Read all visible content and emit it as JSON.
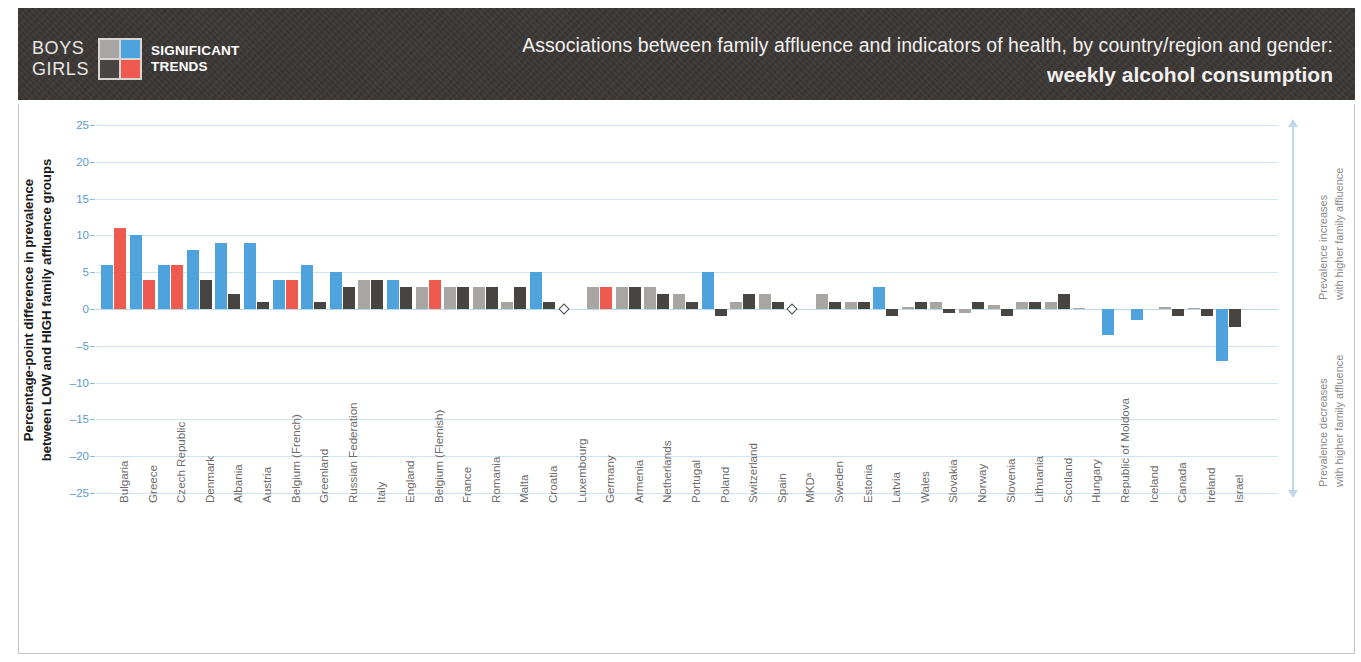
{
  "header": {
    "legend": {
      "boys_label": "BOYS",
      "girls_label": "GIRLS",
      "significant_line1": "SIGNIFICANT",
      "significant_line2": "TRENDS",
      "swatch_boys_nonsig": "#a8a5a2",
      "swatch_boys_sig": "#4ea3dd",
      "swatch_girls_nonsig": "#474442",
      "swatch_girls_sig": "#ee5a4f"
    },
    "title_line1": "Associations between family affluence and indicators of health, by country/region and gender:",
    "title_line2": "weekly alcohol consumption",
    "bg_color": "#3a3634"
  },
  "right_annotation": {
    "increase_bold": "increases",
    "increase_text": "Prevalence increases\nwith higher family affluence",
    "decrease_text": "Prevalence decreases\nwith higher family affluence",
    "axis_color": "#bcd9ec"
  },
  "chart_data": {
    "type": "bar",
    "title": "Associations between family affluence and indicators of health, by country/region and gender: weekly alcohol consumption",
    "xlabel": "",
    "ylabel": "Percentage-point difference in prevalence\nbetween LOW and HIGH family affluence groups",
    "ylim": [
      -25,
      25
    ],
    "yticks": [
      25,
      20,
      15,
      10,
      5,
      0,
      -5,
      -10,
      -15,
      -20,
      -25
    ],
    "grid": true,
    "legend_position": "header-left",
    "series_names": [
      "Boys",
      "Girls"
    ],
    "colors": {
      "boys_significant": "#4ea3dd",
      "boys_nonsignificant": "#a8a5a2",
      "girls_significant": "#ee5a4f",
      "girls_nonsignificant": "#474442",
      "grid": "#cfe4f2",
      "tick_text": "#5b9bd0",
      "category_text": "#6e6b69"
    },
    "categories": [
      "Bulgaria",
      "Greece",
      "Czech Republic",
      "Denmark",
      "Albania",
      "Austria",
      "Belgium (French)",
      "Greenland",
      "Russian Federation",
      "Italy",
      "England",
      "Belgium (Flemish)",
      "France",
      "Romania",
      "Malta",
      "Croatia",
      "Luxembourg",
      "Germany",
      "Armenia",
      "Netherlands",
      "Portugal",
      "Poland",
      "Switzerland",
      "Spain",
      "MKDᵃ",
      "Sweden",
      "Estonia",
      "Latvia",
      "Wales",
      "Slovakia",
      "Norway",
      "Slovenia",
      "Lithuania",
      "Scotland",
      "Hungary",
      "Republic of Moldova",
      "Iceland",
      "Canada",
      "Ireland",
      "Israel"
    ],
    "series": [
      {
        "name": "Boys",
        "values": [
          6,
          10,
          6,
          8,
          9,
          9,
          4,
          6,
          5,
          4,
          4,
          3,
          3,
          3,
          1,
          5,
          0,
          3,
          3,
          3,
          2,
          5,
          1,
          2,
          0,
          2,
          1,
          3,
          0.3,
          1,
          -0.5,
          0.5,
          1,
          1,
          0.2,
          -3.5,
          -1.5,
          0.3,
          0.2,
          -7
        ],
        "significant": [
          true,
          true,
          true,
          true,
          true,
          true,
          true,
          true,
          true,
          false,
          true,
          false,
          false,
          false,
          false,
          true,
          false,
          false,
          false,
          false,
          false,
          true,
          false,
          false,
          false,
          false,
          false,
          true,
          false,
          false,
          false,
          false,
          false,
          false,
          false,
          true,
          true,
          false,
          false,
          true
        ]
      },
      {
        "name": "Girls",
        "values": [
          11,
          4,
          6,
          4,
          2,
          1,
          4,
          1,
          3,
          4,
          3,
          4,
          3,
          3,
          3,
          1,
          0,
          3,
          3,
          2,
          1,
          -1,
          2,
          1,
          0,
          1,
          1,
          -1,
          1,
          -0.5,
          1,
          -1,
          1,
          2,
          0,
          0,
          0,
          -1,
          -1,
          -2.5
        ],
        "significant": [
          true,
          true,
          true,
          false,
          false,
          false,
          true,
          false,
          false,
          false,
          false,
          true,
          false,
          false,
          false,
          false,
          false,
          true,
          false,
          false,
          false,
          false,
          false,
          false,
          false,
          false,
          false,
          false,
          false,
          false,
          false,
          false,
          false,
          false,
          false,
          false,
          false,
          false,
          false,
          false
        ]
      }
    ],
    "zero_markers": [
      "Luxembourg",
      "MKDᵃ",
      "Wales",
      "Slovakia",
      "Slovenia",
      "Scotland",
      "Hungary",
      "Iceland",
      "Canada",
      "Ireland"
    ]
  }
}
